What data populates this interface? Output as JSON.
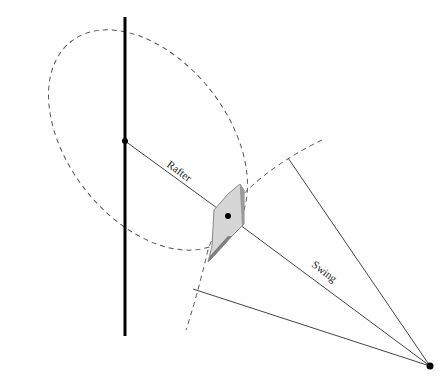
{
  "diagram": {
    "labels": {
      "rafter": "Rafter",
      "swing": "Swing"
    },
    "colors": {
      "line": "#444444",
      "pole": "#000000",
      "dashed": "#555555",
      "plate_light": "#d9d9d9",
      "plate_dark": "#8a8a8a"
    },
    "points": {
      "pole_top": [
        125,
        17
      ],
      "pole_bottom": [
        125,
        336
      ],
      "pivot": [
        125,
        141
      ],
      "plate_center": [
        228,
        216
      ],
      "swing_end": [
        430,
        366
      ],
      "swing_arc_top": [
        288,
        158
      ],
      "swing_arc_bottom": [
        193,
        289
      ]
    }
  }
}
